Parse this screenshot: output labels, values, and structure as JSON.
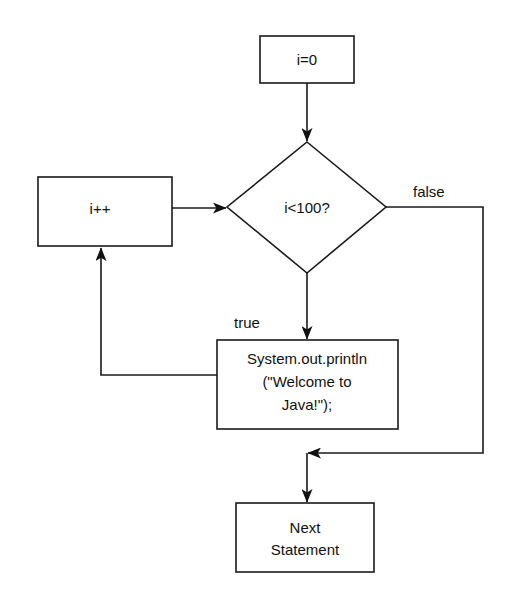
{
  "diagram": {
    "type": "flowchart",
    "title": "",
    "nodes": {
      "init": {
        "shape": "rectangle",
        "lines": [
          "i=0"
        ]
      },
      "condition": {
        "shape": "diamond",
        "lines": [
          "i<100?"
        ]
      },
      "increment": {
        "shape": "rectangle",
        "lines": [
          "i++"
        ]
      },
      "body": {
        "shape": "rectangle",
        "lines": [
          "System.out.println",
          "(\"Welcome to",
          "Java!\");"
        ]
      },
      "next": {
        "shape": "rectangle",
        "lines": [
          "Next",
          "Statement"
        ]
      }
    },
    "edges": [
      {
        "from": "init",
        "to": "condition",
        "label": ""
      },
      {
        "from": "condition",
        "to": "body",
        "label": "true"
      },
      {
        "from": "body",
        "to": "increment",
        "label": ""
      },
      {
        "from": "increment",
        "to": "condition",
        "label": ""
      },
      {
        "from": "condition",
        "to": "next",
        "label": "false"
      }
    ],
    "labels": {
      "true": "true",
      "false": "false"
    }
  }
}
